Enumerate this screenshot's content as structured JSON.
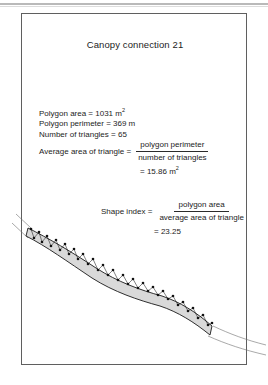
{
  "figure": {
    "title": "Canopy connection 21",
    "stats": {
      "polygon_area_label": "Polygon area = 1031 m",
      "polygon_area_unit": "2",
      "polygon_perimeter": "Polygon perimeter = 369 m",
      "number_of_triangles": "Number of triangles = 65"
    },
    "average_area": {
      "label": "Average area of triangle =",
      "numerator": "polygon perimeter",
      "denominator": "number of triangles",
      "result": "= 15.86 m",
      "result_unit": "2"
    },
    "shape_index": {
      "label": "Shape index =",
      "numerator": "polygon area",
      "denominator": "average area of triangle",
      "result": "= 23.25"
    },
    "diagram": {
      "name": "triangulated-canopy-corridor",
      "description": "Triangulated polygon ribbon representing a canopy connection corridor crossing the figure frame",
      "fill_color": "#d9d9d9",
      "edge_color": "#1a1a1a",
      "outline_color": "#6b6b6b"
    }
  }
}
